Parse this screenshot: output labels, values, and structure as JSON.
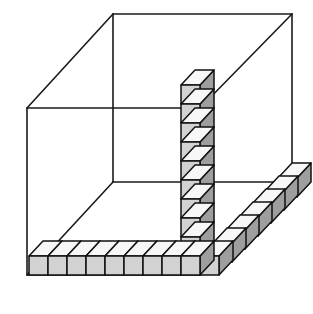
{
  "figure": {
    "background_color": "#ffffff",
    "projection": "oblique",
    "canvas": {
      "width": 313,
      "height": 314
    }
  },
  "colors": {
    "outline": "#1a1a1a",
    "cube_outline": "#111111",
    "cube_front_face": "#d2d2d2",
    "cube_top_face": "#f7f7f7",
    "cube_side_face": "#9e9e9e",
    "background": "#ffffff"
  },
  "box": {
    "name": "wireframe-rectangular-box",
    "vertices": {
      "front_bottom_left": [
        27,
        275
      ],
      "front_bottom_right": [
        200,
        275
      ],
      "front_top_left": [
        27,
        108
      ],
      "front_top_right": [
        200,
        108
      ],
      "back_bottom_left": [
        113,
        182
      ],
      "back_bottom_right": [
        292,
        182
      ],
      "back_top_left": [
        113,
        14
      ],
      "back_top_right": [
        292,
        14
      ]
    },
    "depth_offset": [
      86,
      -93
    ],
    "edge_width": 1.6
  },
  "cube_geometry": {
    "width": 19,
    "height": 19,
    "depth_dx": 14,
    "depth_dy": -15
  },
  "cube_rows": [
    {
      "name": "front-bottom-row",
      "description": "Row of unit cubes along the front bottom edge, running left from the corner",
      "direction": "left",
      "count": 9,
      "origin": [
        181,
        256
      ],
      "step": [
        -19,
        0
      ]
    },
    {
      "name": "vertical-column",
      "description": "Column of unit cubes stacked upward along the front right vertical edge",
      "direction": "up",
      "count": 9,
      "origin": [
        181,
        237
      ],
      "step": [
        0,
        -19
      ]
    },
    {
      "name": "right-depth-row",
      "description": "Row of unit cubes receding back-right along the bottom right edge",
      "direction": "back-right",
      "count": 7,
      "origin": [
        200,
        256
      ],
      "step": [
        13,
        -13
      ]
    }
  ],
  "counts": {
    "front_bottom_row_label": "9",
    "vertical_column_label": "9",
    "right_depth_row_label": "7"
  },
  "chart_data": {
    "type": "diagram",
    "categories": [
      "front bottom row",
      "vertical column",
      "right depth row"
    ],
    "values": [
      9,
      9,
      7
    ],
    "xlabel": "edge",
    "ylabel": "number of unit cubes"
  }
}
